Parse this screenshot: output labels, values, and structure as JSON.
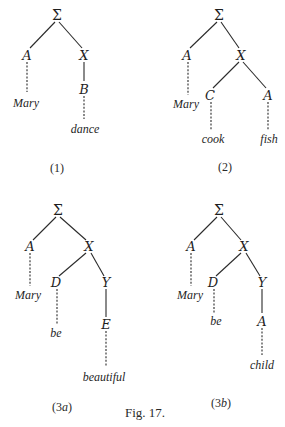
{
  "figure": {
    "caption": "Fig. 17.",
    "background": "#ffffff",
    "ink_color": "#2a2a2a",
    "trees": [
      {
        "id": "1",
        "label": "(1)",
        "root": "Σ",
        "nodes": {
          "sigma": "Σ",
          "a": "A",
          "x": "X",
          "b": "B"
        },
        "words": {
          "mary": "Mary",
          "dance": "dance"
        },
        "structure": "Σ → A, X; A ⇢ Mary; X → B; B ⇢ dance"
      },
      {
        "id": "2",
        "label": "(2)",
        "root": "Σ",
        "nodes": {
          "sigma": "Σ",
          "a": "A",
          "x": "X",
          "c": "C",
          "a2": "A"
        },
        "words": {
          "mary": "Mary",
          "cook": "cook",
          "fish": "fish"
        },
        "structure": "Σ → A, X; A ⇢ Mary; X → C, A; C ⇢ cook; A ⇢ fish"
      },
      {
        "id": "3a",
        "label": "(3a)",
        "label_num": "(3",
        "label_letter": "a",
        "label_close": ")",
        "root": "Σ",
        "nodes": {
          "sigma": "Σ",
          "a": "A",
          "x": "X",
          "d": "D",
          "y": "Y",
          "e": "E"
        },
        "words": {
          "mary": "Mary",
          "be": "be",
          "beautiful": "beautiful"
        },
        "structure": "Σ → A, X; A ⇢ Mary; X → D, Y; D ⇢ be; Y → E; E ⇢ beautiful"
      },
      {
        "id": "3b",
        "label": "(3b)",
        "label_num": "(3",
        "label_letter": "b",
        "label_close": ")",
        "root": "Σ",
        "nodes": {
          "sigma": "Σ",
          "a": "A",
          "x": "X",
          "d": "D",
          "y": "Y",
          "a2": "A"
        },
        "words": {
          "mary": "Mary",
          "be": "be",
          "child": "child"
        },
        "structure": "Σ → A, X; A ⇢ Mary; X → D, Y; D ⇢ be; Y → A; A ⇢ child"
      }
    ]
  }
}
